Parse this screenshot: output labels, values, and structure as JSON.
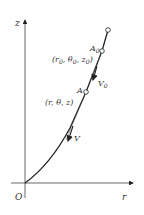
{
  "diagram": {
    "axes": {
      "vertical_label": "z",
      "horizontal_label": "r",
      "origin_label": "O"
    },
    "points": [
      {
        "id": "A0",
        "label": "A",
        "subscript": "0",
        "coords_label": "(r",
        "coords_parts": [
          "(r",
          "0",
          ", θ",
          "0",
          ", z",
          "0",
          ")"
        ]
      },
      {
        "id": "A",
        "label": "A",
        "coords_label": "(r, θ, z)"
      }
    ],
    "vectors": [
      {
        "id": "V0",
        "label": "V",
        "subscript": "0"
      },
      {
        "id": "V",
        "label": "V"
      }
    ],
    "colors": {
      "line": "#222222",
      "text": "#333333",
      "axis": "#444444"
    }
  }
}
